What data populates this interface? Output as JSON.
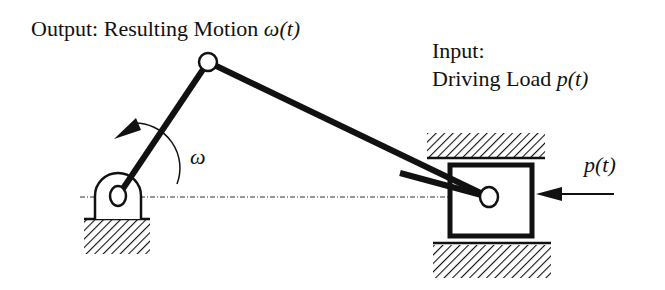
{
  "labels": {
    "output_prefix": "Output: Resulting Motion ",
    "output_symbol": "ω(t)",
    "input_line1": "Input:",
    "input_line2_prefix": "Driving Load ",
    "input_symbol": "p(t)",
    "omega": "ω",
    "force": "p(t)"
  },
  "colors": {
    "ink": "#111111",
    "background": "#ffffff"
  }
}
